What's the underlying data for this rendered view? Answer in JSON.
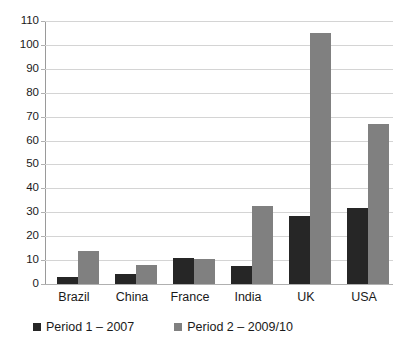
{
  "chart_data": {
    "type": "bar",
    "title": "",
    "subtitle": "",
    "xlabel": "",
    "ylabel": "",
    "categories": [
      "Brazil",
      "China",
      "France",
      "India",
      "UK",
      "USA"
    ],
    "series": [
      {
        "name": "Period 1 – 2007",
        "color": "#262626",
        "values": [
          3,
          4,
          11,
          7.5,
          28.5,
          32
        ]
      },
      {
        "name": "Period 2 – 2009/10",
        "color": "#808080",
        "values": [
          14,
          8,
          10.5,
          32.5,
          105,
          67
        ]
      }
    ],
    "ylim": [
      0,
      110
    ],
    "ytick_step": 10,
    "yticks": [
      0,
      10,
      20,
      30,
      40,
      50,
      60,
      70,
      80,
      90,
      100,
      110
    ],
    "ytick_labels": [
      "0",
      "10",
      "20",
      "30",
      "40",
      "50",
      "60",
      "70",
      "80",
      "90",
      "100",
      "110"
    ],
    "grid": {
      "horizontal": true,
      "vertical": false,
      "color": "#d4d4d4"
    },
    "legend": {
      "position": "bottom-left",
      "entries": [
        "Period 1 – 2007",
        "Period 2 – 2009/10"
      ]
    },
    "background": "#ffffff",
    "axis_color": "#9a9a9a"
  }
}
